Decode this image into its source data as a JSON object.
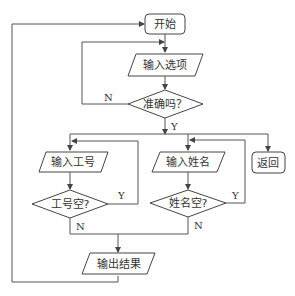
{
  "diagram": {
    "type": "flowchart",
    "nodes": {
      "start": {
        "label": "开始",
        "shape": "rounded-rect"
      },
      "input_option": {
        "label": "输入选项",
        "shape": "parallelogram"
      },
      "decision_correct": {
        "label": "准确吗？",
        "shape": "diamond"
      },
      "input_id": {
        "label": "输入工号",
        "shape": "parallelogram"
      },
      "decision_id_empty": {
        "label": "工号空?",
        "shape": "diamond"
      },
      "input_name": {
        "label": "输入姓名",
        "shape": "parallelogram"
      },
      "decision_name_empty": {
        "label": "姓名空?",
        "shape": "diamond"
      },
      "return": {
        "label": "返回",
        "shape": "rounded-rect"
      },
      "output_result": {
        "label": "输出结果",
        "shape": "parallelogram"
      }
    },
    "edge_labels": {
      "correct_no": "N",
      "correct_yes": "Y",
      "id_empty_yes": "Y",
      "id_empty_no": "N",
      "name_empty_yes": "Y",
      "name_empty_no": "N"
    }
  }
}
